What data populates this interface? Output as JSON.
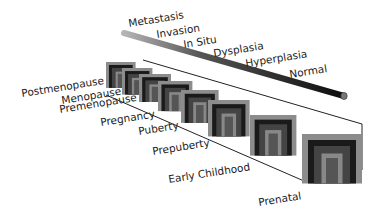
{
  "diagram": {
    "type": "3d-window-timeline",
    "disease_progression_axis": {
      "labels": [
        "Metastasis",
        "Invasion",
        "In Situ",
        "Dysplasia",
        "Hyperplasia",
        "Normal"
      ]
    },
    "life_stage_axis": {
      "labels": [
        "Postmenopause",
        "Menopause",
        "Premenopause",
        "Pregnancy",
        "Puberty",
        "Prepuberty",
        "Early Childhood",
        "Prenatal"
      ]
    },
    "colors": {
      "rod_dark": "#111111",
      "rod_light": "#9a9a9a",
      "frame_gray": "#8c8c8c",
      "frame_black": "#1a1a1a",
      "outline": "#222222"
    }
  }
}
